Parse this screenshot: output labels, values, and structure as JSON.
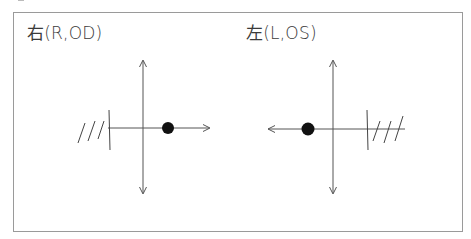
{
  "panels": [
    {
      "id": "right-eye",
      "label": "右(R,OD)",
      "dot_side": "right",
      "hatched_side": "left"
    },
    {
      "id": "left-eye",
      "label": "左(L,OS)",
      "dot_side": "left",
      "hatched_side": "right"
    }
  ],
  "colors": {
    "line": "#555555",
    "dot": "#111111",
    "border": "#9a9a9a",
    "text": "#3a3a3a"
  }
}
